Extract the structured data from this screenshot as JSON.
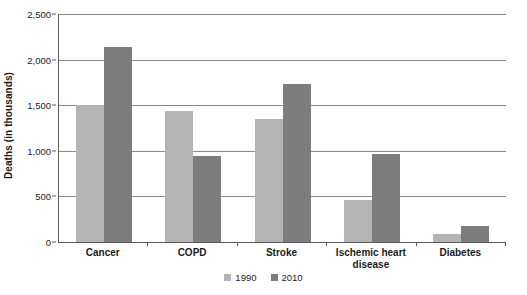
{
  "chart_data": {
    "type": "bar",
    "title": "",
    "xlabel": "",
    "ylabel": "Deaths (in thousands)",
    "ylim": [
      0,
      2500
    ],
    "ytick_values": [
      0,
      500,
      1000,
      1500,
      2000,
      2500
    ],
    "ytick_labels": [
      "0",
      "500",
      "1,000",
      "1,500",
      "2,000",
      "2,500"
    ],
    "grid": true,
    "legend_position": "bottom-center",
    "categories": [
      "Cancer",
      "COPD",
      "Stroke",
      "Ischemic heart disease",
      "Diabetes"
    ],
    "category_labels": [
      "Cancer",
      "COPD",
      "Stroke",
      "Ischemic heart\ndisease",
      "Diabetes"
    ],
    "series": [
      {
        "name": "1990",
        "color": "#b4b4b4",
        "values": [
          1500,
          1435,
          1345,
          460,
          90
        ]
      },
      {
        "name": "2010",
        "color": "#7d7d7d",
        "values": [
          2140,
          945,
          1730,
          960,
          175
        ]
      }
    ]
  },
  "legend": {
    "items": [
      {
        "label": "1990",
        "color": "#b4b4b4"
      },
      {
        "label": "2010",
        "color": "#7d7d7d"
      }
    ]
  },
  "axes": {
    "y_title": "Deaths (in thousands)"
  }
}
